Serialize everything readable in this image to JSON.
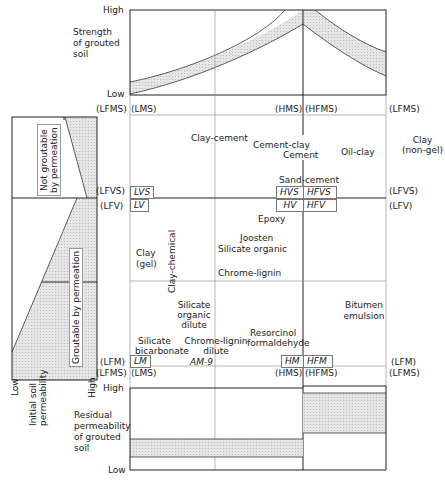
{
  "top_chart": {
    "ylabel": "Strength of grouted soil",
    "ylabel_lines": [
      "Strength",
      "of grouted",
      "soil"
    ],
    "y_high": "High",
    "y_low": "Low"
  },
  "bottom_chart": {
    "ylabel_lines": [
      "Residual",
      "permeability",
      "of grouted",
      "soil"
    ],
    "y_high": "High",
    "y_low": "Low"
  },
  "left_panel": {
    "region_top": [
      "Not groutable",
      "by permeation"
    ],
    "region_bottom": "Groutable by permeation",
    "x_low": "Low",
    "x_high": "High",
    "xlabel_lines": [
      "Initial soil",
      "permeability"
    ]
  },
  "axis_labels": {
    "top_row": {
      "lfms_left": "(LFMS)",
      "lms": "(LMS)",
      "hms": "(HMS)",
      "hfms": "(HFMS)",
      "lfms_right": "(LFMS)"
    },
    "vs_row": {
      "lfvs_left": "(LFVS)",
      "lfvs_right": "(LFVS)"
    },
    "v_row": {
      "lfv_left": "(LFV)",
      "lfv_right": "(LFV)"
    },
    "m_row": {
      "lfm_left": "(LFM)",
      "lfm_right": "(LFM)"
    },
    "ms_row": {
      "lfms_left": "(LFMS)",
      "lms": "(LMS)",
      "hms": "(HMS)",
      "hfms": "(HFMS)",
      "lfms_right": "(LFMS)"
    }
  },
  "boxes": {
    "lvs": "LVS",
    "lv": "LV",
    "hvs": "HVS",
    "hfvs": "HFVS",
    "hv": "HV",
    "hfv": "HFV",
    "lm": "LM",
    "am9": "AM-9",
    "hm": "HM",
    "hfm": "HFM"
  },
  "grouts": {
    "clay_cement": "Clay-cement",
    "cement_clay": "Cement-clay",
    "cement": "Cement",
    "oil_clay": "Oil-clay",
    "clay_nongel": [
      "Clay",
      "(non-gel)"
    ],
    "sand_cement": "Sand-cement",
    "epoxy": "Epoxy",
    "joosten": "Joosten",
    "silicate_organic": "Silicate organic",
    "clay_gel": [
      "Clay",
      "(gel)"
    ],
    "clay_chemical": "Clay-chemical",
    "chrome_lignin": "Chrome-lignin",
    "silicate_organic_dilute": [
      "Silicate",
      "organic",
      "dilute"
    ],
    "bitumen_emulsion": [
      "Bitumen",
      "emulsion"
    ],
    "silicate_bicarbonate": [
      "Silicate",
      "bicarbonate"
    ],
    "chrome_lignin_dilute": [
      "Chrome-lignin",
      "dilute"
    ],
    "resorcinol_formaldehyde": [
      "Resorcinol",
      "formaldehyde"
    ]
  },
  "colors": {
    "line": "#222222",
    "shade": "#d9d9d9",
    "grid": "#888888"
  }
}
